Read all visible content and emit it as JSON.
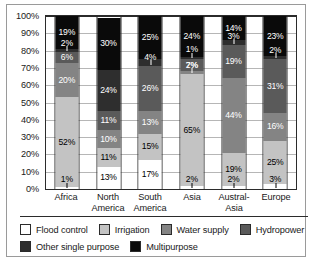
{
  "chart_data": {
    "type": "bar",
    "stacked": true,
    "normalized_percent": true,
    "title": "",
    "xlabel": "",
    "ylabel": "",
    "ylim": [
      0,
      100
    ],
    "ytick_labels": [
      "100%",
      "90%",
      "80%",
      "70%",
      "60%",
      "50%",
      "40%",
      "30%",
      "20%",
      "10%",
      "0%"
    ],
    "ytick_values": [
      100,
      90,
      80,
      70,
      60,
      50,
      40,
      30,
      20,
      10,
      0
    ],
    "grid": true,
    "legend_position": "bottom",
    "categories": [
      "Africa",
      "North America",
      "South America",
      "Asia",
      "Austral-Asia",
      "Europe"
    ],
    "category_lines": [
      [
        "Africa"
      ],
      [
        "North",
        "America"
      ],
      [
        "South",
        "America"
      ],
      [
        "Asia"
      ],
      [
        "Austral-",
        "Asia"
      ],
      [
        "Europe"
      ]
    ],
    "series": [
      {
        "name": "Flood control",
        "color": "#ffffff",
        "values": [
          1,
          13,
          17,
          2,
          2,
          3
        ]
      },
      {
        "name": "Irrigation",
        "color": "#c3c3c3",
        "values": [
          52,
          11,
          15,
          65,
          19,
          25
        ]
      },
      {
        "name": "Water supply",
        "color": "#848484",
        "values": [
          20,
          10,
          13,
          2,
          44,
          16
        ]
      },
      {
        "name": "Hydropower",
        "color": "#5a5a5a",
        "values": [
          6,
          11,
          26,
          7,
          19,
          31
        ]
      },
      {
        "name": "Other single purpose",
        "color": "#2e2e2e",
        "values": [
          2,
          24,
          4,
          1,
          3,
          2
        ]
      },
      {
        "name": "Multipurpose",
        "color": "#0a0a0a",
        "values": [
          19,
          30,
          25,
          24,
          14,
          23
        ]
      }
    ],
    "data_labels": {
      "Africa": [
        "1%",
        "52%",
        "20%",
        "6%",
        "2%",
        "19%"
      ],
      "North America": [
        "13%",
        "11%",
        "10%",
        "11%",
        "24%",
        "30%"
      ],
      "South America": [
        "17%",
        "15%",
        "13%",
        "26%",
        "4%",
        "25%"
      ],
      "Asia": [
        "2%",
        "65%",
        "2%",
        "7%",
        "1%",
        "24%"
      ],
      "Austral-Asia": [
        "2%",
        "19%",
        "44%",
        "19%",
        "3%",
        "14%"
      ],
      "Europe": [
        "3%",
        "25%",
        "16%",
        "31%",
        "2%",
        "23%"
      ]
    }
  },
  "legend": {
    "row1": [
      {
        "label": "Flood control",
        "color": "#ffffff"
      },
      {
        "label": "Irrigation",
        "color": "#c3c3c3"
      },
      {
        "label": "Water supply",
        "color": "#848484"
      },
      {
        "label": "Hydropower",
        "color": "#5a5a5a"
      }
    ],
    "row2": [
      {
        "label": "Other single purpose",
        "color": "#2e2e2e"
      },
      {
        "label": "Multipurpose",
        "color": "#0a0a0a"
      }
    ]
  }
}
